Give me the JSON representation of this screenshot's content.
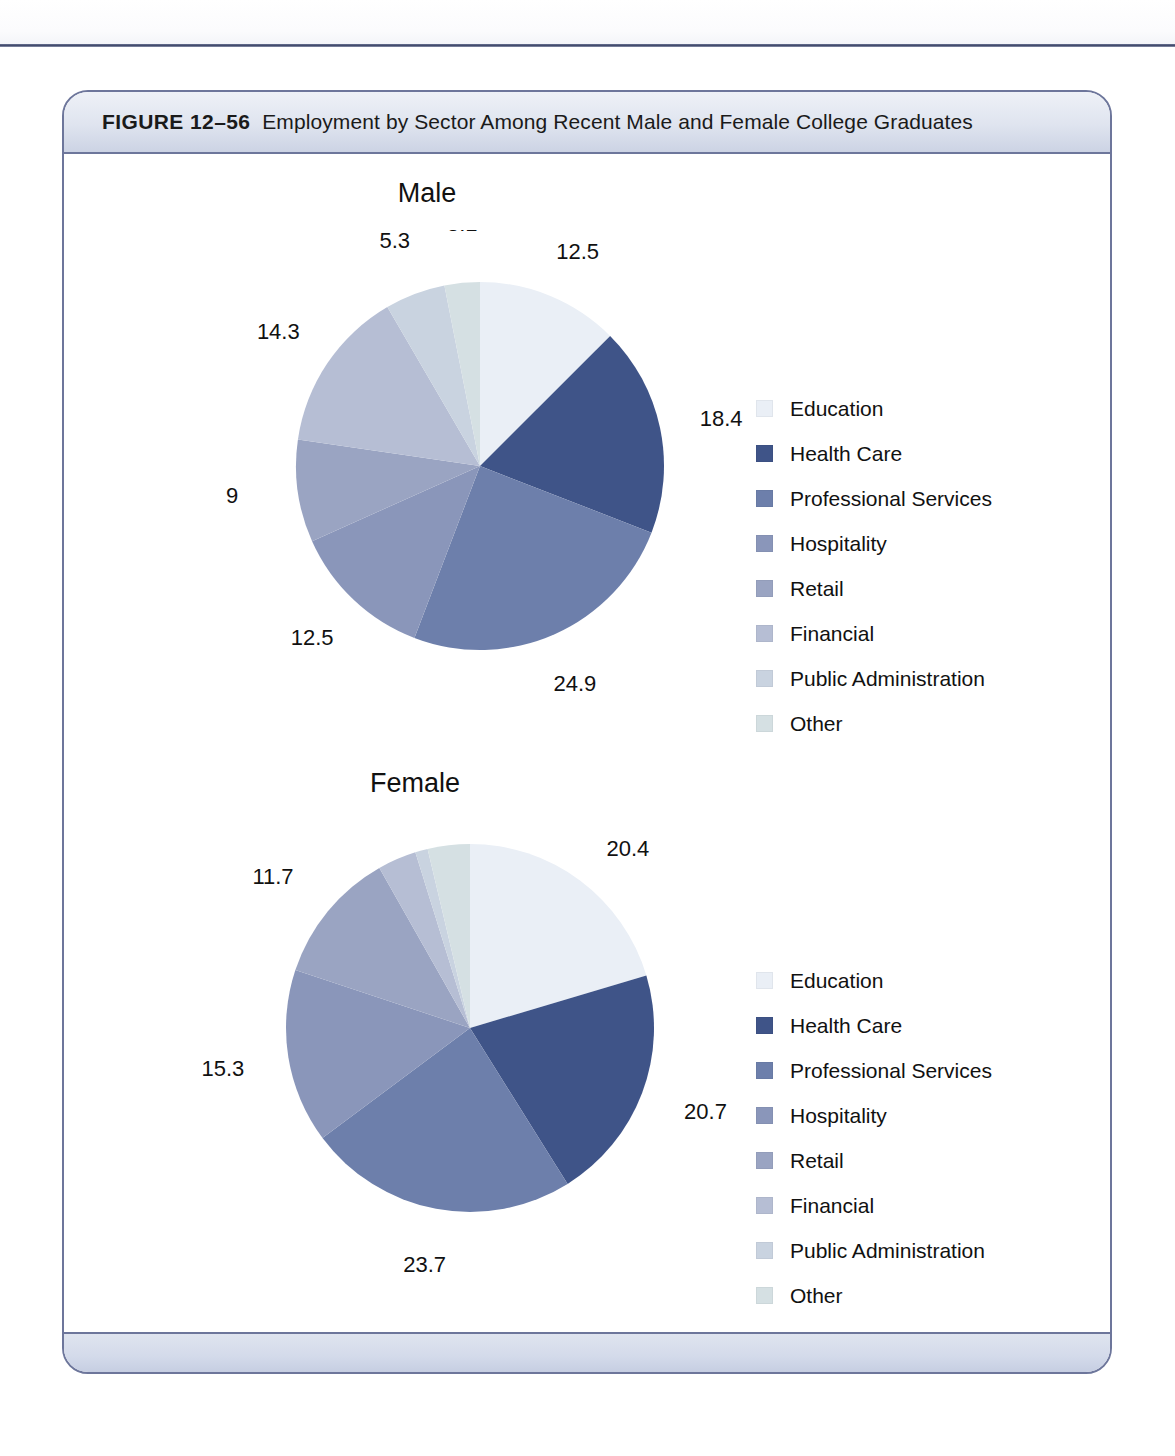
{
  "figure": {
    "number": "FIGURE 12–56",
    "title": "Employment by Sector Among Recent Male and Female College Graduates"
  },
  "palette": {
    "education": "#eaeff6",
    "health_care": "#3f5488",
    "professional_services": "#6d7fab",
    "hospitality": "#8a96ba",
    "retail": "#9aa4c2",
    "financial": "#b6bed4",
    "public_administration": "#c9d3e0",
    "other": "#d5e0e3",
    "card_border": "#6d769b",
    "header_band": "#dfe4ef",
    "footer_band": "#d3daea",
    "text": "#111111"
  },
  "legend_labels": [
    "Education",
    "Health Care",
    "Professional Services",
    "Hospitality",
    "Retail",
    "Financial",
    "Public Administration",
    "Other"
  ],
  "chart_data": [
    {
      "type": "pie",
      "title": "Male",
      "categories": [
        "Education",
        "Health Care",
        "Professional Services",
        "Hospitality",
        "Retail",
        "Financial",
        "Public Administration",
        "Other"
      ],
      "values": [
        12.5,
        18.4,
        24.9,
        12.5,
        9,
        14.3,
        5.3,
        3.1
      ],
      "value_labels": [
        "12.5",
        "18.4",
        "24.9",
        "12.5",
        "9",
        "14.3",
        "5.3",
        "3.1"
      ],
      "colors": [
        "#eaeff6",
        "#3f5488",
        "#6d7fab",
        "#8a96ba",
        "#9aa4c2",
        "#b6bed4",
        "#c9d3e0",
        "#d5e0e3"
      ],
      "start_angle_deg": 0,
      "direction": "clockwise",
      "legend_position": "right",
      "units": "percent"
    },
    {
      "type": "pie",
      "title": "Female",
      "categories": [
        "Education",
        "Health Care",
        "Professional Services",
        "Hospitality",
        "Retail",
        "Financial",
        "Public Administration",
        "Other"
      ],
      "values": [
        20.4,
        20.7,
        23.7,
        15.3,
        11.7,
        3.4,
        1.1,
        3.7
      ],
      "value_labels": [
        "20.4",
        "20.7",
        "23.7",
        "15.3",
        "11.7",
        "3.4",
        "1.1",
        "3.7"
      ],
      "colors": [
        "#eaeff6",
        "#3f5488",
        "#6d7fab",
        "#8a96ba",
        "#9aa4c2",
        "#b6bed4",
        "#c9d3e0",
        "#d5e0e3"
      ],
      "start_angle_deg": 0,
      "direction": "clockwise",
      "legend_position": "right",
      "units": "percent"
    }
  ]
}
